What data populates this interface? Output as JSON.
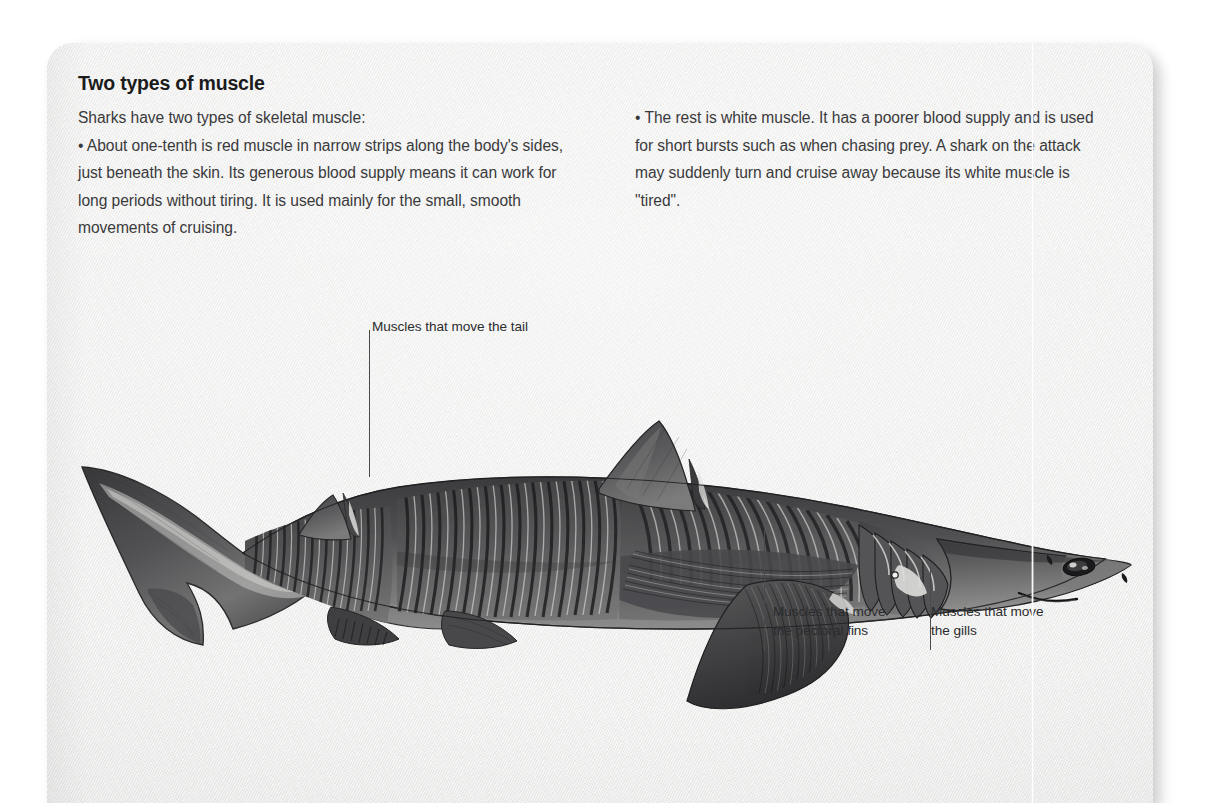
{
  "page": {
    "background_color": "#ffffff",
    "paper_color": "#f1f1f0",
    "text_color": "#3a3a3c",
    "heading_color": "#1b1b1b",
    "ink_color": "#4a4a4c"
  },
  "article": {
    "heading": "Two types of muscle",
    "columns": {
      "left": [
        "Sharks have two types of skeletal muscle:",
        "• About one-tenth is red muscle in narrow strips along the body's sides, just beneath the skin. Its generous blood supply means it can work for long periods without tiring. It is used mainly for the small, smooth movements of cruising."
      ],
      "right": [
        "• The rest is white muscle. It has a poorer blood supply and is used for short bursts such as when chasing prey. A shark on the attack may suddenly turn and cruise away because its white muscle is \"tired\"."
      ]
    }
  },
  "figure": {
    "callouts": [
      {
        "id": "tail",
        "text": "Muscles that move the tail"
      },
      {
        "id": "pectoral",
        "text": "Muscles that move\nthe pectoral fins"
      },
      {
        "id": "gills",
        "text": "Muscles that move\nthe gills"
      }
    ]
  }
}
